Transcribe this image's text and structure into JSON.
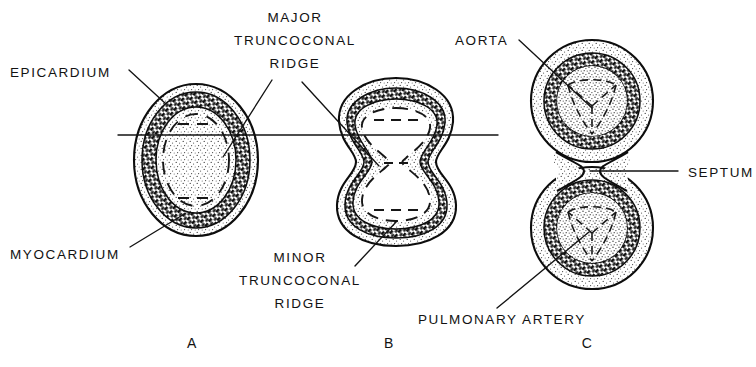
{
  "figure": {
    "background_color": "#ffffff",
    "ink_color": "#111111",
    "width": 756,
    "height": 367
  },
  "labels": {
    "epicardium": "EPICARDIUM",
    "myocardium": "MYOCARDIUM",
    "major_ridge_line1": "MAJOR",
    "major_ridge_line2": "TRUNCOCONAL",
    "major_ridge_line3": "RIDGE",
    "minor_ridge_line1": "MINOR",
    "minor_ridge_line2": "TRUNCOCONAL",
    "minor_ridge_line3": "RIDGE",
    "aorta": "AORTA",
    "septum": "SEPTUM",
    "pulmonary_artery": "PULMONARY  ARTERY"
  },
  "panels": [
    {
      "letter": "A",
      "description": "Single oval truncus with epicardium, myocardium and unseptated lumen"
    },
    {
      "letter": "B",
      "description": "Peanut-shaped truncus with major and minor truncoconal ridges indenting the lumen"
    },
    {
      "letter": "C",
      "description": "Fully septated truncus forming separate aorta and pulmonary artery with tri-leaflet valves"
    }
  ],
  "callouts": [
    {
      "name": "epicardium",
      "target_panel": "A"
    },
    {
      "name": "myocardium",
      "target_panel": "A"
    },
    {
      "name": "major-truncoconal-ridge",
      "target_panel": "A"
    },
    {
      "name": "major-truncoconal-ridge",
      "target_panel": "B"
    },
    {
      "name": "minor-truncoconal-ridge",
      "target_panel": "B"
    },
    {
      "name": "aorta",
      "target_panel": "C"
    },
    {
      "name": "septum",
      "target_panel": "C"
    },
    {
      "name": "pulmonary-artery",
      "target_panel": "C"
    }
  ]
}
